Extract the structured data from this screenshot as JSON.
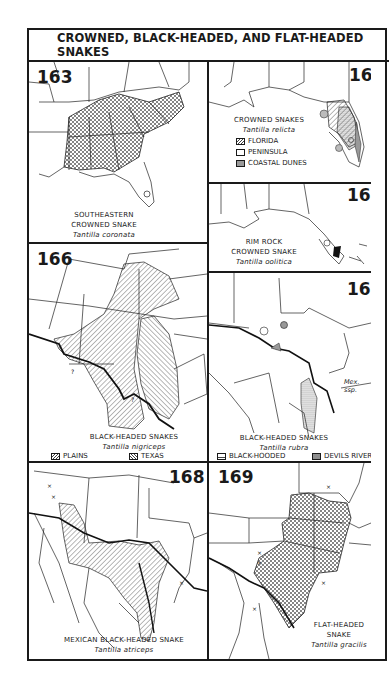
{
  "page": {
    "title": "CROWNED, BLACK-HEADED, AND FLAT-HEADED SNAKES"
  },
  "maps": {
    "m163": {
      "number": "163",
      "common_name_1": "SOUTHEASTERN",
      "common_name_2": "CROWNED SNAKE",
      "scientific_name": "Tantilla coronata"
    },
    "m164": {
      "number": "164",
      "common_name": "CROWNED SNAKES",
      "scientific_name": "Tantilla relicta",
      "legend": [
        {
          "label": "FLORIDA",
          "pattern": "diagonal-hatch"
        },
        {
          "label": "PENINSULA",
          "pattern": "stipple"
        },
        {
          "label": "COASTAL DUNES",
          "pattern": "solid-gray"
        }
      ]
    },
    "m165": {
      "number": "165",
      "common_name_1": "RIM ROCK",
      "common_name_2": "CROWNED SNAKE",
      "scientific_name": "Tantilla oolitica"
    },
    "m166": {
      "number": "166",
      "common_name": "BLACK-HEADED SNAKES",
      "scientific_name": "Tantilla nigriceps",
      "legend": [
        {
          "label": "PLAINS",
          "pattern": "diagonal-hatch-right"
        },
        {
          "label": "TEXAS",
          "pattern": "diagonal-hatch-left"
        }
      ],
      "question_marks": [
        "?",
        "?"
      ]
    },
    "m167": {
      "number": "167",
      "common_name": "BLACK-HEADED SNAKES",
      "scientific_name": "Tantilla rubra",
      "annotation": "Mex. ssp.",
      "legend": [
        {
          "label": "BLACK-HOODED",
          "pattern": "grid"
        },
        {
          "label": "DEVILS RIVER",
          "pattern": "solid-gray"
        }
      ]
    },
    "m168": {
      "number": "168",
      "common_name": "MEXICAN BLACK-HEADED SNAKE",
      "scientific_name": "Tantilla atriceps"
    },
    "m169": {
      "number": "169",
      "common_name_1": "FLAT-HEADED",
      "common_name_2": "SNAKE",
      "scientific_name": "Tantilla gracilis"
    }
  },
  "colors": {
    "ink": "#1a1a1a",
    "paper": "#ffffff",
    "range_fill": "#bdbdbd"
  }
}
